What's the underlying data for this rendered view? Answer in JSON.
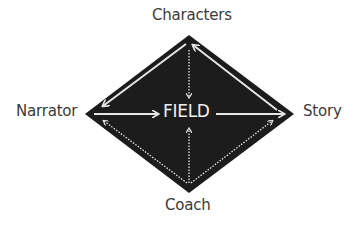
{
  "diagram": {
    "center": "FIELD",
    "nodes": {
      "top": "Characters",
      "left": "Narrator",
      "right": "Story",
      "bottom": "Coach"
    },
    "edges": [
      {
        "from": "Characters",
        "to": "Narrator",
        "style": "solid",
        "bidirectional": false
      },
      {
        "from": "Story",
        "to": "Characters",
        "style": "solid",
        "bidirectional": false
      },
      {
        "from": "Narrator",
        "to": "FIELD",
        "style": "solid"
      },
      {
        "from": "FIELD",
        "to": "Story",
        "style": "solid"
      },
      {
        "from": "Characters",
        "to": "FIELD",
        "style": "dotted"
      },
      {
        "from": "Coach",
        "to": "FIELD",
        "style": "dotted"
      },
      {
        "from": "Coach",
        "to": "Narrator",
        "style": "dotted"
      },
      {
        "from": "Coach",
        "to": "Story",
        "style": "dotted"
      }
    ],
    "colors": {
      "diamond_fill": "#1c1c1c",
      "arrow": "#e6e6e6",
      "label_text": "#3a3a3a",
      "center_text": "#f0f0f0",
      "background": "#ffffff"
    }
  }
}
